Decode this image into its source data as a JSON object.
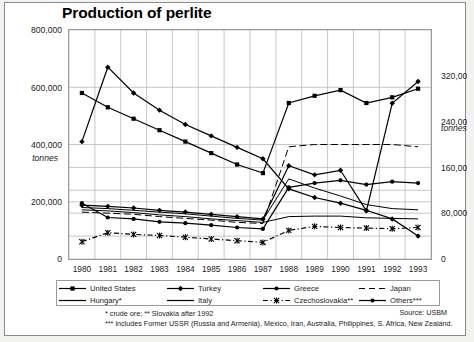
{
  "chart_data": {
    "type": "line",
    "title": "Production of perlite",
    "xlabel": "",
    "ylabel": "tonnes",
    "ylabel_right": "tonnes",
    "grid": true,
    "legend_position": "bottom",
    "x": [
      1980,
      1981,
      1982,
      1983,
      1984,
      1985,
      1986,
      1987,
      1988,
      1989,
      1990,
      1991,
      1992,
      1993
    ],
    "categories": [
      "1980",
      "1981",
      "1982",
      "1983",
      "1984",
      "1985",
      "1986",
      "1987",
      "1988",
      "1989",
      "1990",
      "1991",
      "1992",
      "1993"
    ],
    "ylim": [
      0,
      800000
    ],
    "yticks": [
      0,
      200000,
      400000,
      600000,
      800000
    ],
    "yticklabels": [
      "0",
      "200,000",
      "400,000",
      "600,000",
      "800,000"
    ],
    "ylim_right": [
      0,
      400000
    ],
    "yticks_right": [
      0,
      80000,
      160000,
      240000,
      320000
    ],
    "yticklabels_right": [
      "0",
      "80,000",
      "160,000",
      "240,000",
      "320,000"
    ],
    "series": [
      {
        "name": "United States",
        "axis": "left",
        "marker": "square",
        "style": "solid",
        "values": [
          580000,
          530000,
          490000,
          450000,
          410000,
          370000,
          330000,
          300000,
          545000,
          570000,
          590000,
          545000,
          565000,
          595000
        ]
      },
      {
        "name": "Turkey",
        "axis": "left",
        "marker": "diamond",
        "style": "solid",
        "values": [
          410000,
          670000,
          580000,
          520000,
          470000,
          430000,
          390000,
          350000,
          245000,
          215000,
          195000,
          170000,
          140000,
          80000
        ]
      },
      {
        "name": "Others***",
        "axis": "left",
        "marker": "circle",
        "style": "solid",
        "values": [
          195000,
          145000,
          140000,
          130000,
          125000,
          118000,
          110000,
          105000,
          250000,
          265000,
          275000,
          260000,
          270000,
          265000
        ]
      },
      {
        "name": "Japan",
        "axis": "right",
        "marker": "none",
        "style": "dashed",
        "values": [
          82000,
          80000,
          78000,
          74000,
          71000,
          68000,
          64000,
          62000,
          196000,
          200000,
          200000,
          200000,
          200000,
          196000
        ]
      },
      {
        "name": "Greece",
        "axis": "right",
        "marker": "diamond",
        "style": "solid",
        "values": [
          94000,
          92000,
          89000,
          85000,
          82000,
          78000,
          74000,
          70000,
          163000,
          147000,
          155000,
          84000,
          272000,
          310000
        ]
      },
      {
        "name": "Hungary*",
        "axis": "right",
        "marker": "none",
        "style": "solid",
        "values": [
          90000,
          88000,
          85000,
          82000,
          79000,
          75000,
          71000,
          68000,
          140000,
          124000,
          110000,
          95000,
          88000,
          86000
        ]
      },
      {
        "name": "Italy",
        "axis": "right",
        "marker": "none",
        "style": "solid",
        "values": [
          86000,
          84000,
          81000,
          77000,
          74000,
          70000,
          67000,
          64000,
          74000,
          75000,
          75000,
          72000,
          71000,
          70000
        ]
      },
      {
        "name": "Czechoslovakia**",
        "axis": "right",
        "marker": "cross",
        "style": "dash-dot",
        "values": [
          30000,
          46000,
          43000,
          41000,
          38000,
          35000,
          32000,
          29000,
          50000,
          57000,
          55000,
          54000,
          53000,
          55000
        ]
      }
    ]
  },
  "title": "Production of perlite",
  "axes": {
    "left_unit": "tonnes",
    "right_unit": "tonnes",
    "left_ticks": [
      "800,000",
      "600,000",
      "400,000",
      "200,000",
      "0"
    ],
    "right_ticks": [
      "320,000",
      "240,000",
      "160,000",
      "80,000",
      "0"
    ],
    "years": [
      "1980",
      "1981",
      "1982",
      "1983",
      "1984",
      "1985",
      "1986",
      "1987",
      "1988",
      "1989",
      "1990",
      "1991",
      "1992",
      "1993"
    ]
  },
  "legend": {
    "row1": [
      {
        "label": "United States",
        "symbol": "square-line"
      },
      {
        "label": "Turkey",
        "symbol": "diamond-line"
      },
      {
        "label": "Greece",
        "symbol": "circle-line"
      },
      {
        "label": "Japan",
        "symbol": "dashed-line"
      }
    ],
    "row2": [
      {
        "label": "Hungary*",
        "symbol": "plain-line"
      },
      {
        "label": "Italy",
        "symbol": "plain-line"
      },
      {
        "label": "Czechoslovakia**",
        "symbol": "cross-dashdot-line"
      },
      {
        "label": "Others***",
        "symbol": "circle-line"
      }
    ]
  },
  "notes": {
    "note1": "* crude ore; ** Slovakia after 1992",
    "note2": "*** includes Former USSR (Russia and Armenia), Mexico, Iran, Australia, Philippines, S. Africa, New Zealand.",
    "source": "Source: USBM"
  }
}
